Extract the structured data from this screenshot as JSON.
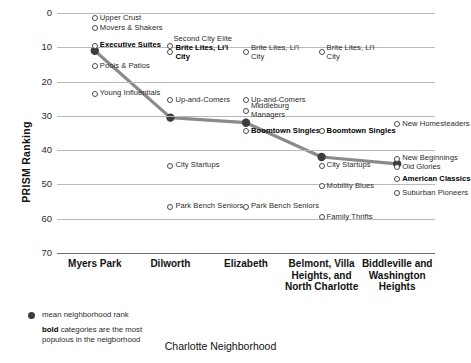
{
  "chart_data": {
    "type": "scatter",
    "title": "",
    "xlabel": "Charlotte Neighborhood",
    "ylabel": "PRISM Ranking",
    "ylim": [
      0,
      70
    ],
    "y_inverted": true,
    "yticks": [
      0,
      10,
      20,
      30,
      40,
      50,
      60,
      70
    ],
    "grid": true,
    "legend_position": "below-left",
    "categories": [
      "Myers Park",
      "Dilworth",
      "Elizabeth",
      "Belmont, Villa Heights, and North Charlotte",
      "Biddleville and Washington Heights"
    ],
    "series": [
      {
        "name": "mean neighborhood rank",
        "values": [
          11,
          30.5,
          32,
          42,
          44
        ]
      }
    ],
    "points": [
      {
        "category": "Myers Park",
        "label": "Upper Crust",
        "value": 1.5,
        "bold": false
      },
      {
        "category": "Myers Park",
        "label": "Movers & Shakers",
        "value": 4.5,
        "bold": false
      },
      {
        "category": "Myers Park",
        "label": "Executive Suites",
        "value": 9.5,
        "bold": true
      },
      {
        "category": "Myers Park",
        "label": "Pools & Patios",
        "value": 15.5,
        "bold": false
      },
      {
        "category": "Myers Park",
        "label": "Young Influentials",
        "value": 23.5,
        "bold": false
      },
      {
        "category": "Dilworth",
        "label": "Second City Elite",
        "value": 9.5,
        "bold": false
      },
      {
        "category": "Dilworth",
        "label": "Brite Lites, Li'l City",
        "value": 11.5,
        "bold": true
      },
      {
        "category": "Dilworth",
        "label": "Up-and-Comers",
        "value": 25.5,
        "bold": false
      },
      {
        "category": "Dilworth",
        "label": "City Startups",
        "value": 44.5,
        "bold": false
      },
      {
        "category": "Dilworth",
        "label": "Park Bench Seniors",
        "value": 56.5,
        "bold": false
      },
      {
        "category": "Elizabeth",
        "label": "Brite Lites, Li'l City",
        "value": 11.5,
        "bold": false
      },
      {
        "category": "Elizabeth",
        "label": "Up-and-Comers",
        "value": 25.5,
        "bold": false
      },
      {
        "category": "Elizabeth",
        "label": "Middleburg Managers",
        "value": 28.5,
        "bold": false
      },
      {
        "category": "Elizabeth",
        "label": "Boomtown Singles",
        "value": 34.5,
        "bold": true
      },
      {
        "category": "Elizabeth",
        "label": "Park Bench Seniors",
        "value": 56.5,
        "bold": false
      },
      {
        "category": "Belmont, Villa Heights, and North Charlotte",
        "label": "Brite Lites, Li'l City",
        "value": 11.5,
        "bold": false
      },
      {
        "category": "Belmont, Villa Heights, and North Charlotte",
        "label": "Boomtown Singles",
        "value": 34.5,
        "bold": true
      },
      {
        "category": "Belmont, Villa Heights, and North Charlotte",
        "label": "City Startups",
        "value": 44.5,
        "bold": false
      },
      {
        "category": "Belmont, Villa Heights, and North Charlotte",
        "label": "Mobility Blues",
        "value": 50.5,
        "bold": false
      },
      {
        "category": "Belmont, Villa Heights, and North Charlotte",
        "label": "Family Thrifts",
        "value": 59.5,
        "bold": false
      },
      {
        "category": "Biddleville and Washington Heights",
        "label": "New Homesteaders",
        "value": 32.5,
        "bold": false
      },
      {
        "category": "Biddleville and Washington Heights",
        "label": "New Beginnings",
        "value": 42.5,
        "bold": false
      },
      {
        "category": "Biddleville and Washington Heights",
        "label": "Old Glories",
        "value": 45.0,
        "bold": false
      },
      {
        "category": "Biddleville and Washington Heights",
        "label": "American Classics",
        "value": 48.5,
        "bold": true
      },
      {
        "category": "Biddleville and Washington Heights",
        "label": "Suburban Pioneers",
        "value": 52.5,
        "bold": false
      }
    ],
    "colors": {
      "line": "#8a8a8a",
      "marker_fill": "#3d3d3d",
      "marker_open": "#4a4a4a",
      "grid": "#b9b9b9",
      "text": "#1a1a1a"
    }
  },
  "legend": {
    "mean_label": "mean neighborhood rank",
    "note_bold": "bold",
    "note_rest": " categories are the most populous in the neigborhood"
  }
}
